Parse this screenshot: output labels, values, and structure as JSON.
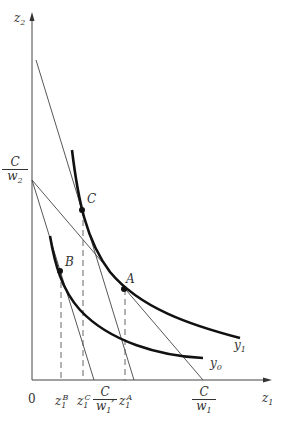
{
  "diagram": {
    "type": "economics isoquant cost-minimization diagram",
    "axes": {
      "x_label": "z",
      "x_sub": "1",
      "y_label": "z",
      "y_sub": "2",
      "origin_label": "0"
    },
    "points": {
      "A": "A",
      "B": "B",
      "C": "C"
    },
    "curves": {
      "y1": {
        "label": "y",
        "sub": "1"
      },
      "y0": {
        "label": "y",
        "sub": "0"
      }
    },
    "intercepts": {
      "y_intercept": {
        "num": "C",
        "den": "w",
        "den_sub": "2"
      },
      "x_intercept_new": {
        "num": "C",
        "den": "w",
        "den_sub": "1",
        "den_prime": "′"
      },
      "x_intercept_old": {
        "num": "C",
        "den": "w",
        "den_sub": "1"
      }
    },
    "tick_labels": {
      "zB": {
        "base": "z",
        "sub": "1",
        "sup": "B"
      },
      "zC": {
        "base": "z",
        "sub": "1",
        "sup": "C"
      },
      "zA": {
        "base": "z",
        "sub": "1",
        "sup": "A"
      }
    },
    "colors": {
      "line": "#333333",
      "curve": "#111111"
    }
  }
}
